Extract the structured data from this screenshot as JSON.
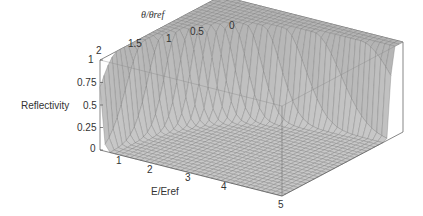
{
  "chart_data": {
    "type": "surface3d",
    "title": "",
    "zlabel": "Reflectivity",
    "xlabel": "E/Eref",
    "ylabel": "θ/θref",
    "x_ticks": [
      "1",
      "2",
      "3",
      "4",
      "5"
    ],
    "y_ticks": [
      "2",
      "1.5",
      "1",
      "0.5",
      "0"
    ],
    "z_ticks": [
      "0",
      "0.25",
      "0.5",
      "0.75",
      "1"
    ],
    "xlim": [
      0.5,
      5
    ],
    "ylim": [
      0,
      2
    ],
    "zlim": [
      0,
      1
    ],
    "samples": [
      {
        "E": 0.5,
        "theta": 0,
        "R": 1.0
      },
      {
        "E": 0.5,
        "theta": 1,
        "R": 1.0
      },
      {
        "E": 0.5,
        "theta": 2,
        "R": 0.95
      },
      {
        "E": 1,
        "theta": 0.5,
        "R": 1.0
      },
      {
        "E": 1,
        "theta": 1,
        "R": 0.9
      },
      {
        "E": 1,
        "theta": 2,
        "R": 0.0
      },
      {
        "E": 2,
        "theta": 0.25,
        "R": 1.0
      },
      {
        "E": 2,
        "theta": 0.5,
        "R": 0.9
      },
      {
        "E": 2,
        "theta": 1,
        "R": 0.0
      },
      {
        "E": 3,
        "theta": 0.2,
        "R": 1.0
      },
      {
        "E": 3,
        "theta": 0.5,
        "R": 0.1
      },
      {
        "E": 4,
        "theta": 0.1,
        "R": 1.0
      },
      {
        "E": 4,
        "theta": 0.4,
        "R": 0.0
      },
      {
        "E": 5,
        "theta": 0.0,
        "R": 1.0
      },
      {
        "E": 5,
        "theta": 0.2,
        "R": 0.2
      },
      {
        "E": 5,
        "theta": 2,
        "R": 0.0
      }
    ],
    "grid": true,
    "legend": null
  },
  "labels": {
    "zlabel": "Reflectivity",
    "xlabel": "E/Eref",
    "ylabel": "θ/θref"
  }
}
